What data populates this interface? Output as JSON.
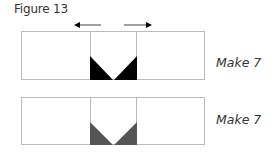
{
  "figure": {
    "title": "Figure 13",
    "arrows": [
      "left",
      "right"
    ],
    "units": [
      {
        "label": "Make 7",
        "triangle_color": "#000000",
        "shade": "black"
      },
      {
        "label": "Make 7",
        "triangle_color": "#555555",
        "shade": "gray"
      }
    ],
    "line_color": "#bbbbbb"
  }
}
